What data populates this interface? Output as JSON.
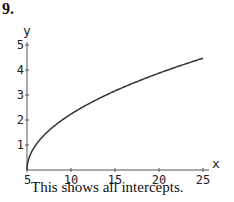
{
  "problem": {
    "number": "9."
  },
  "caption": "This shows all intercepts.",
  "chart_data": {
    "type": "line",
    "title": "",
    "xlabel": "x",
    "ylabel": "y",
    "xlim": [
      5,
      25
    ],
    "ylim": [
      0,
      5
    ],
    "grid": false,
    "x_ticks": [
      5,
      10,
      15,
      20,
      25
    ],
    "y_ticks": [
      1,
      2,
      3,
      4,
      5
    ],
    "x_tick_labels": [
      "5",
      "10",
      "15",
      "20",
      "25"
    ],
    "y_tick_labels": [
      "1",
      "2",
      "3",
      "4",
      "5"
    ],
    "series": [
      {
        "name": "y = sqrt(x - 5)",
        "x": [
          5,
          5.25,
          6,
          7,
          9,
          11,
          13,
          15,
          17,
          19,
          21,
          23,
          25
        ],
        "values": [
          0,
          0.5,
          1.0,
          1.41,
          2.0,
          2.45,
          2.83,
          3.16,
          3.46,
          3.74,
          4.0,
          4.24,
          4.47
        ]
      }
    ],
    "colors": {
      "curve": "#333333",
      "axis": "#555555"
    }
  }
}
